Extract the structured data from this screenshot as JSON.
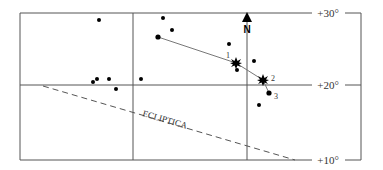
{
  "diagram": {
    "labels": {
      "dec_top": "+30°",
      "dec_mid": "+20°",
      "dec_bottom": "+10°",
      "north": "N",
      "ecliptic": "ECLIPTICA",
      "point1": "1",
      "point2": "2",
      "point3": "3"
    },
    "colors": {
      "line": "#555555",
      "dot": "#000000",
      "path": "#777777"
    }
  }
}
